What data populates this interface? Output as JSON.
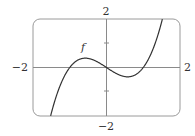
{
  "chart_data": {
    "type": "line",
    "title": "",
    "xlabel": "",
    "ylabel": "",
    "xlim": [
      -2,
      2
    ],
    "ylim": [
      -2,
      2
    ],
    "grid": false,
    "x_tick_labels": [
      "-2",
      "2"
    ],
    "y_tick_labels": [
      "2",
      "-2"
    ],
    "y_ticks": [
      -1,
      1
    ],
    "series": [
      {
        "name": "f",
        "function": "f(x) = x^3 - x",
        "x": [
          -1.52,
          -1.25,
          -1.0,
          -0.75,
          -0.577,
          -0.4,
          -0.2,
          0,
          0.2,
          0.4,
          0.577,
          0.75,
          1.0,
          1.25,
          1.52
        ],
        "values": [
          -1.99,
          -0.7,
          0.0,
          0.33,
          0.385,
          0.34,
          0.19,
          0,
          -0.19,
          -0.34,
          -0.385,
          -0.33,
          0.0,
          0.7,
          1.99
        ]
      }
    ],
    "annotations": [
      {
        "text": "f",
        "x": -0.63,
        "y": 0.83
      }
    ]
  },
  "labels": {
    "top": "2",
    "bottom": "−2",
    "left": "−2",
    "right": "2",
    "curve": "f"
  },
  "colors": {
    "frame": "#9a9a9a",
    "axes": "#8a8a8a",
    "curve": "#333333",
    "text": "#333333"
  }
}
